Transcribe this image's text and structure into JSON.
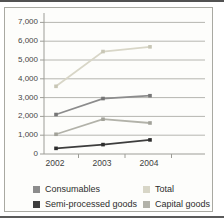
{
  "figure": {
    "background_color": "#ffffff",
    "frame_border_color": "#a9a9a2",
    "top_rule_color": "#525252",
    "bottom_rule_color": "#5a5a5a"
  },
  "chart_data": {
    "type": "line",
    "title": "",
    "xlabel": "",
    "ylabel": "",
    "categories": [
      "2002",
      "2003",
      "2004"
    ],
    "series": [
      {
        "name": "Total",
        "values": [
          3600,
          5450,
          5700
        ],
        "color": "#d8d6c7",
        "marker_color": "#c8c6b5"
      },
      {
        "name": "Capital goods",
        "values": [
          1050,
          1850,
          1650
        ],
        "color": "#b2b2a9",
        "marker_color": "#a2a299"
      },
      {
        "name": "Consumables",
        "values": [
          2100,
          2950,
          3100
        ],
        "color": "#8c8c8c",
        "marker_color": "#767676"
      },
      {
        "name": "Semi-processed goods",
        "values": [
          300,
          500,
          750
        ],
        "color": "#3d3d3d",
        "marker_color": "#2d2d2d"
      }
    ],
    "ylim": [
      0,
      7000
    ],
    "ytick_step": 1000,
    "ytick_labels": [
      "0",
      "1,000",
      "2,000",
      "3,000",
      "4,000",
      "5,000",
      "6,000",
      "7,000"
    ],
    "grid": true,
    "gridline_color": "#b6b6b0",
    "axis_color": "#9d9d97",
    "marker_shape": "square",
    "legend_position": "bottom",
    "legend_items": [
      "Consumables",
      "Total",
      "Semi-processed goods",
      "Capital goods"
    ]
  }
}
